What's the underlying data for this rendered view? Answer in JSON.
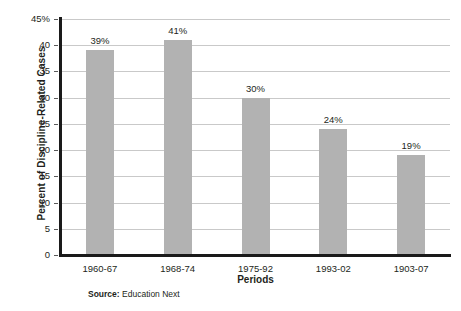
{
  "chart_data": {
    "type": "bar",
    "title": "",
    "xlabel": "Periods",
    "ylabel": "Percent of Discipline-Related Cases",
    "categories": [
      "1960-67",
      "1968-74",
      "1975-92",
      "1993-02",
      "1903-07"
    ],
    "values": [
      39,
      41,
      30,
      24,
      19
    ],
    "data_labels": [
      "39%",
      "41%",
      "30%",
      "24%",
      "19%"
    ],
    "ylim": [
      0,
      45
    ],
    "ytick_values": [
      0,
      5,
      10,
      15,
      20,
      25,
      30,
      35,
      40,
      45
    ],
    "ytick_labels": [
      "0",
      "5",
      "10",
      "15",
      "20",
      "25",
      "30",
      "35",
      "40",
      "45%"
    ],
    "grid": true,
    "legend": null,
    "bar_color": "#b2b2b2",
    "grid_color": "#c9c9c9",
    "axis_color": "#1a1a1a"
  },
  "source": {
    "label": "Source:",
    "text": "Education Next"
  }
}
